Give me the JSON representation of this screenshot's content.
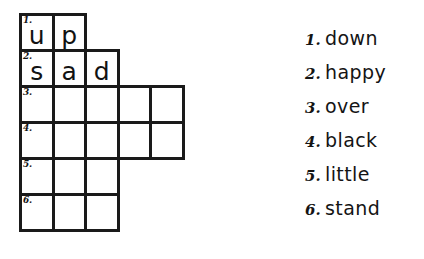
{
  "worksheet": {
    "title": "Crossword puzzle worksheet",
    "background_color": "#ffffff",
    "ink_color": "#1a1a1a"
  },
  "crossword": {
    "name": "crossword-grid",
    "rows": [
      {
        "number": "1.",
        "cell_count": 2,
        "letters": [
          "u",
          "p",
          "",
          "",
          ""
        ]
      },
      {
        "number": "2.",
        "cell_count": 3,
        "letters": [
          "s",
          "a",
          "d",
          "",
          ""
        ]
      },
      {
        "number": "3.",
        "cell_count": 5,
        "letters": [
          "",
          "",
          "",
          "",
          ""
        ]
      },
      {
        "number": "4.",
        "cell_count": 5,
        "letters": [
          "",
          "",
          "",
          "",
          ""
        ]
      },
      {
        "number": "5.",
        "cell_count": 3,
        "letters": [
          "",
          "",
          "",
          "",
          ""
        ]
      },
      {
        "number": "6.",
        "cell_count": 3,
        "letters": [
          "",
          "",
          "",
          "",
          ""
        ]
      }
    ]
  },
  "wordlist": {
    "name": "word-list",
    "items": [
      {
        "number": "1.",
        "word": "down"
      },
      {
        "number": "2.",
        "word": "happy"
      },
      {
        "number": "3.",
        "word": "over"
      },
      {
        "number": "4.",
        "word": "black"
      },
      {
        "number": "5.",
        "word": "little"
      },
      {
        "number": "6.",
        "word": "stand"
      }
    ]
  }
}
